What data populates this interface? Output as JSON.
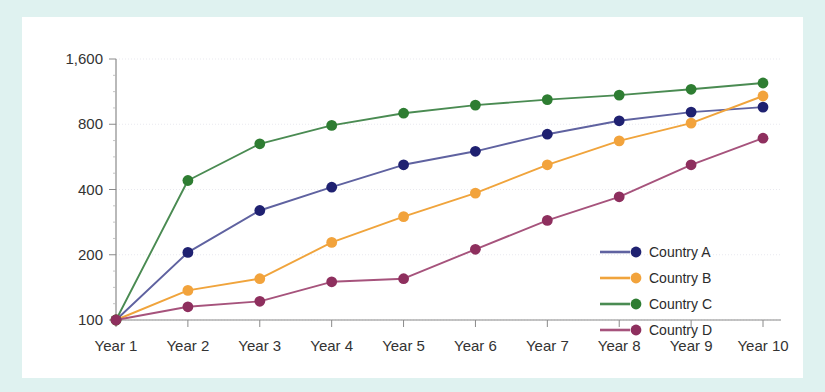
{
  "chart_data": {
    "type": "line",
    "title": "",
    "xlabel": "",
    "ylabel": "",
    "categories": [
      "Year 1",
      "Year 2",
      "Year 3",
      "Year 4",
      "Year 5",
      "Year 6",
      "Year 7",
      "Year 8",
      "Year 9",
      "Year 10"
    ],
    "yscale": "log",
    "ylim": [
      100,
      1600
    ],
    "yticks": [
      100,
      200,
      400,
      800,
      1600
    ],
    "ytick_labels": [
      "100",
      "200",
      "400",
      "800",
      "1,600"
    ],
    "grid": true,
    "legend_position": "center-right",
    "series": [
      {
        "name": "Country A",
        "color": "#5f62a0",
        "marker_color": "#1f2171",
        "values": [
          100,
          205,
          320,
          410,
          520,
          600,
          720,
          830,
          910,
          960
        ]
      },
      {
        "name": "Country B",
        "color": "#f0a43c",
        "marker_color": "#f2a33c",
        "values": [
          100,
          137,
          155,
          228,
          300,
          385,
          520,
          670,
          810,
          1080
        ]
      },
      {
        "name": "Country C",
        "color": "#4a8b52",
        "marker_color": "#2e7d32",
        "values": [
          100,
          440,
          650,
          790,
          900,
          980,
          1040,
          1090,
          1160,
          1240
        ]
      },
      {
        "name": "Country D",
        "color": "#a6537c",
        "marker_color": "#8e2f5e",
        "values": [
          100,
          115,
          122,
          150,
          155,
          212,
          288,
          370,
          520,
          690
        ]
      }
    ]
  },
  "theme": {
    "page_background": "#dff2f0",
    "card_background": "#ffffff",
    "axis_color": "#8a8a8a",
    "grid_color": "#e9e9ef",
    "text_color": "#333333"
  }
}
